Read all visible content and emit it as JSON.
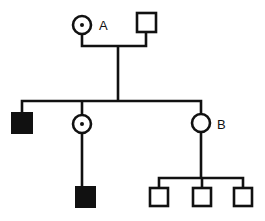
{
  "diagram": {
    "type": "pedigree",
    "colors": {
      "stroke": "#111111",
      "affected_fill": "#111111",
      "unaffected_fill": "#ffffff",
      "background": "#ffffff"
    },
    "generation_1": {
      "mother": {
        "sex": "female",
        "status": "carrier",
        "label": "A"
      },
      "father": {
        "sex": "male",
        "status": "unaffected",
        "label": ""
      }
    },
    "generation_2": [
      {
        "sex": "male",
        "status": "affected",
        "label": ""
      },
      {
        "sex": "female",
        "status": "carrier",
        "label": ""
      },
      {
        "sex": "female",
        "status": "unaffected",
        "label": "B"
      }
    ],
    "generation_3": [
      {
        "parent": "generation_2.1",
        "sex": "male",
        "status": "affected",
        "label": ""
      },
      {
        "parent": "B",
        "sex": "male",
        "status": "unaffected",
        "label": ""
      },
      {
        "parent": "B",
        "sex": "male",
        "status": "unaffected",
        "label": ""
      },
      {
        "parent": "B",
        "sex": "male",
        "status": "unaffected",
        "label": ""
      }
    ]
  }
}
